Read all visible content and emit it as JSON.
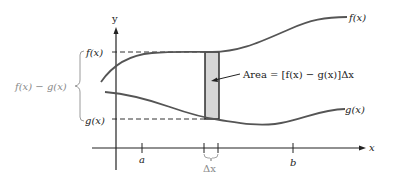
{
  "diagram": {
    "axes": {
      "y_label": "y",
      "x_label": "x"
    },
    "curves": {
      "f_label": "f(x)",
      "g_label": "g(x)"
    },
    "left_labels": {
      "f_value": "f(x)",
      "g_value": "g(x)",
      "difference": "f(x) − g(x)"
    },
    "annotation": {
      "area_text": "Area = [f(x) − g(x)]Δx"
    },
    "ticks": {
      "a": "a",
      "b": "b",
      "delta_x": "Δx"
    },
    "colors": {
      "curve": "#555555",
      "axis": "#222222",
      "rect_fill": "#d6d6d6",
      "rect_stroke": "#222222",
      "brace": "#9a9a9a"
    }
  }
}
